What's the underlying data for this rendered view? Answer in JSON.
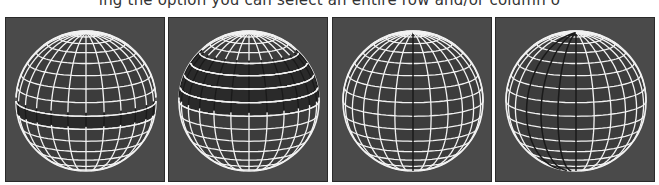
{
  "caption": "ing the option you can select an entire row and/or column o",
  "panels": [
    {
      "id": "panel-1",
      "description": "sphere wireframe with a single row selected",
      "selection": {
        "type": "row",
        "rows": [
          8
        ]
      }
    },
    {
      "id": "panel-2",
      "description": "sphere wireframe with multiple rows selected",
      "selection": {
        "type": "rows",
        "rows": [
          4,
          5,
          6,
          7
        ]
      }
    },
    {
      "id": "panel-3",
      "description": "sphere wireframe with a single column selected",
      "selection": {
        "type": "column",
        "columns": [
          0
        ]
      }
    },
    {
      "id": "panel-4",
      "description": "sphere wireframe with multiple columns selected",
      "selection": {
        "type": "columns",
        "columns": [
          -3,
          -2,
          -1,
          0
        ]
      }
    }
  ],
  "colors": {
    "background": "#4a4a4a",
    "wire": "#f2f2f2",
    "selected": "#1a1a1a"
  }
}
